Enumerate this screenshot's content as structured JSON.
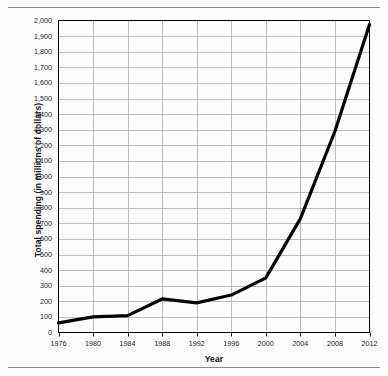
{
  "chart_data": {
    "type": "line",
    "title": "",
    "xlabel": "Year",
    "ylabel": "Total spending (in millions of dollars)",
    "x": [
      1976,
      1980,
      1984,
      1988,
      1992,
      1996,
      2000,
      2004,
      2008,
      2012
    ],
    "values": [
      62,
      100,
      108,
      215,
      190,
      240,
      350,
      730,
      1290,
      1975
    ],
    "series": [
      {
        "name": "Total spending",
        "values": [
          62,
          100,
          108,
          215,
          190,
          240,
          350,
          730,
          1290,
          1975
        ]
      }
    ],
    "xtick_labels": [
      "1976",
      "1980",
      "1984",
      "1988",
      "1992",
      "1996",
      "2000",
      "2004",
      "2008",
      "2012"
    ],
    "ytick_labels": [
      "0",
      "100",
      "200",
      "300",
      "400",
      "500",
      "600",
      "700",
      "800",
      "900",
      "1,000",
      "1,100",
      "1,200",
      "1,300",
      "1,400",
      "1,500",
      "1,600",
      "1,700",
      "1,800",
      "1,900",
      "2,000"
    ],
    "ytick_values": [
      0,
      100,
      200,
      300,
      400,
      500,
      600,
      700,
      800,
      900,
      1000,
      1100,
      1200,
      1300,
      1400,
      1500,
      1600,
      1700,
      1800,
      1900,
      2000
    ],
    "xlim": [
      1976,
      2012
    ],
    "ylim": [
      0,
      2000
    ],
    "grid": true,
    "legend": "none",
    "line_color": "#000000",
    "grid_color": "#a9a9a9",
    "axis_color": "#000000",
    "background_color": "#ffffff"
  }
}
